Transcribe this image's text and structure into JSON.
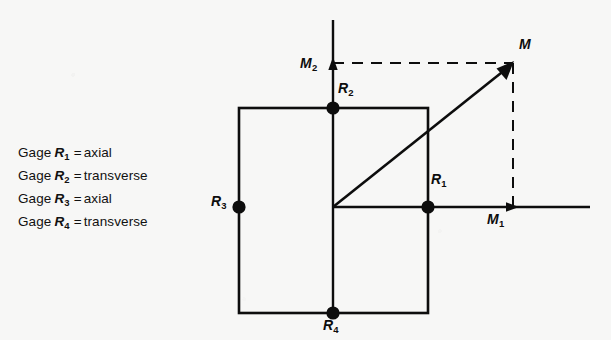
{
  "figure": {
    "background_color": "#f7f7f6",
    "ink_color": "#0d0d0d",
    "legend": {
      "lines": [
        {
          "prefix": "Gage",
          "symbol": "R",
          "subscript": "1",
          "equals": "=",
          "value": "axial"
        },
        {
          "prefix": "Gage",
          "symbol": "R",
          "subscript": "2",
          "equals": "=",
          "value": "transverse"
        },
        {
          "prefix": "Gage",
          "symbol": "R",
          "subscript": "3",
          "equals": "=",
          "value": "axial"
        },
        {
          "prefix": "Gage",
          "symbol": "R",
          "subscript": "4",
          "equals": "=",
          "value": "transverse"
        }
      ]
    },
    "labels": {
      "m_vector": "M",
      "m_axis_vertical": "M",
      "m_axis_vertical_sub": "2",
      "m_axis_horizontal": "M",
      "m_axis_horizontal_sub": "1",
      "gage_1": "R",
      "gage_1_sub": "1",
      "gage_2": "R",
      "gage_2_sub": "2",
      "gage_3": "R",
      "gage_3_sub": "3",
      "gage_4": "R",
      "gage_4_sub": "4"
    },
    "geometry": {
      "square": {
        "left": 239,
        "top": 108,
        "right": 428,
        "bottom": 313
      },
      "origin": {
        "x": 333,
        "y": 207
      },
      "m_point": {
        "x": 513,
        "y": 63
      },
      "vertical_axis": {
        "x": 333,
        "y_top": 20,
        "y_bottom": 313
      },
      "horizontal_axis": {
        "y": 207,
        "x_left": 333,
        "x_right": 590
      },
      "gage_dots": [
        {
          "name": "R1",
          "x": 428,
          "y": 207
        },
        {
          "name": "R2",
          "x": 333,
          "y": 108
        },
        {
          "name": "R3",
          "x": 239,
          "y": 207
        },
        {
          "name": "R4",
          "x": 333,
          "y": 313
        }
      ]
    }
  }
}
